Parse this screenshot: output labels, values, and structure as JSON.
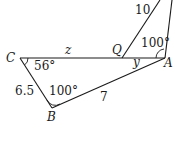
{
  "diagram": {
    "type": "geometry-figure",
    "points": {
      "C": {
        "label": "C",
        "x": 20,
        "y": 58
      },
      "A": {
        "label": "A",
        "x": 165,
        "y": 58
      },
      "B": {
        "label": "B",
        "x": 52,
        "y": 108
      },
      "Q": {
        "label": "Q",
        "x": 122,
        "y": 58
      }
    },
    "segments": [
      {
        "from": "C",
        "to": "A",
        "label": "z",
        "note": "z labels segment CQ"
      },
      {
        "from": "C",
        "to": "B",
        "label": "6.5"
      },
      {
        "from": "B",
        "to": "A",
        "label": "7"
      },
      {
        "from": "Q",
        "to": "top",
        "label": "10"
      },
      {
        "from": "A",
        "to": "top",
        "label": ""
      }
    ],
    "angles": {
      "C": "56°",
      "B": "100°",
      "A_upper": "100°",
      "A_lower": "y"
    },
    "labels": {
      "point_C": "C",
      "point_A": "A",
      "point_B": "B",
      "point_Q": "Q",
      "side_z": "z",
      "side_CB": "6.5",
      "side_BA": "7",
      "side_Q_top": "10",
      "angle_C": "56°",
      "angle_B": "100°",
      "angle_A_upper": "100°",
      "angle_y": "y"
    }
  }
}
